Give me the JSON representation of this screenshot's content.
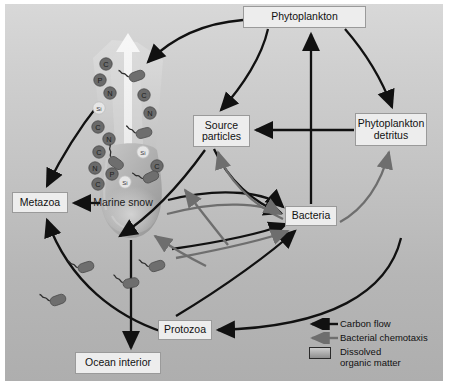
{
  "figure": {
    "background_top": "#d8d8d8",
    "background_bottom": "#aeaeae",
    "carbon_flow_color": "#111111",
    "chemotaxis_color": "#6e6e6e"
  },
  "nodes": {
    "phytoplankton": "Phytoplankton",
    "source_particles": "Source\nparticles",
    "source_particles_line1": "Source",
    "source_particles_line2": "particles",
    "phytoplankton_detritus_line1": "Phytoplankton",
    "phytoplankton_detritus_line2": "detritus",
    "bacteria": "Bacteria",
    "metazoa": "Metazoa",
    "protozoa": "Protozoa",
    "ocean_interior": "Ocean interior",
    "marine_snow": "Marine snow"
  },
  "legend": {
    "items": [
      {
        "key": "black-arrow",
        "label": "Carbon flow",
        "color": "#111111"
      },
      {
        "key": "gray-arrow",
        "label": "Bacterial chemotaxis",
        "color": "#6e6e6e"
      },
      {
        "key": "gray-swatch",
        "label_line1": "Dissolved",
        "label_line2": "organic matter",
        "color": "#a9a9a9"
      }
    ]
  },
  "plume": {
    "description": "Dissolved organic matter plume rising from marine snow aggregate",
    "nutrient_labels_dark": [
      "C",
      "P",
      "N",
      "C",
      "N",
      "C",
      "N",
      "P",
      "C",
      "C",
      "N",
      "C"
    ],
    "nutrient_labels_light": [
      "Si",
      "Si",
      "Si",
      "Si"
    ],
    "particles": [
      {
        "label": "C",
        "x": 106,
        "y": 64,
        "kind": "dark"
      },
      {
        "label": "P",
        "x": 100,
        "y": 80,
        "kind": "dark"
      },
      {
        "label": "N",
        "x": 110,
        "y": 93,
        "kind": "dark"
      },
      {
        "label": "Si",
        "x": 99,
        "y": 108,
        "kind": "light"
      },
      {
        "label": "C",
        "x": 98,
        "y": 127,
        "kind": "dark"
      },
      {
        "label": "N",
        "x": 109,
        "y": 139,
        "kind": "dark"
      },
      {
        "label": "C",
        "x": 99,
        "y": 152,
        "kind": "dark"
      },
      {
        "label": "N",
        "x": 95,
        "y": 168,
        "kind": "dark"
      },
      {
        "label": "P",
        "x": 112,
        "y": 174,
        "kind": "dark"
      },
      {
        "label": "C",
        "x": 98,
        "y": 184,
        "kind": "dark"
      },
      {
        "label": "Si",
        "x": 125,
        "y": 182,
        "kind": "light"
      },
      {
        "label": "C",
        "x": 144,
        "y": 95,
        "kind": "dark"
      },
      {
        "label": "N",
        "x": 150,
        "y": 113,
        "kind": "dark"
      },
      {
        "label": "Si",
        "x": 143,
        "y": 152,
        "kind": "light"
      },
      {
        "label": "C",
        "x": 157,
        "y": 166,
        "kind": "dark"
      }
    ]
  },
  "bacteria_cells": [
    {
      "x": 137,
      "y": 76,
      "rot": -20
    },
    {
      "x": 144,
      "y": 133,
      "rot": -15
    },
    {
      "x": 116,
      "y": 163,
      "rot": 35
    },
    {
      "x": 151,
      "y": 177,
      "rot": -25
    },
    {
      "x": 86,
      "y": 267,
      "rot": -18
    },
    {
      "x": 58,
      "y": 300,
      "rot": -20
    },
    {
      "x": 131,
      "y": 283,
      "rot": -12
    },
    {
      "x": 157,
      "y": 266,
      "rot": -18
    }
  ]
}
